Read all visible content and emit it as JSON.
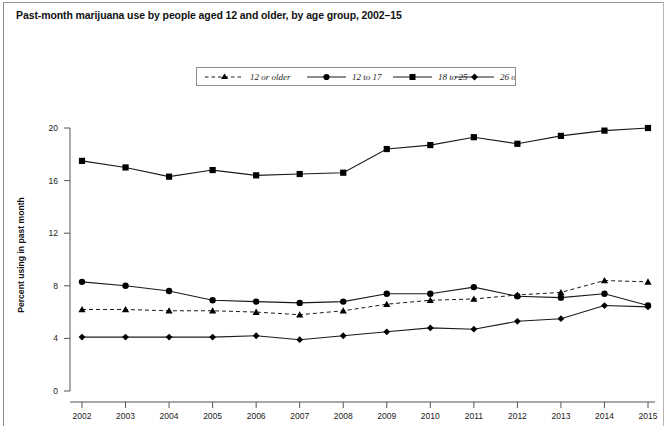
{
  "figure": {
    "title": "Past-month marijuana use by people aged 12 and older, by age group, 2002–15"
  },
  "legend": {
    "position": "top-center",
    "entries": [
      {
        "label": "12 or older",
        "marker": "triangle",
        "line": "dashed"
      },
      {
        "label": "12 to 17",
        "marker": "circle",
        "line": "solid"
      },
      {
        "label": "18 to 25",
        "marker": "square",
        "line": "solid"
      },
      {
        "label": "26 or older",
        "marker": "diamond",
        "line": "solid"
      }
    ]
  },
  "axes": {
    "ylabel": "Percent using in past month",
    "xlabel": "",
    "yticks": [
      "0",
      "4",
      "8",
      "12",
      "16",
      "20"
    ],
    "xticks": [
      "2002",
      "2003",
      "2004",
      "2005",
      "2006",
      "2007",
      "2008",
      "2009",
      "2010",
      "2011",
      "2012",
      "2013",
      "2014",
      "2015"
    ]
  },
  "colors": {
    "line": "#1a1a1a",
    "marker": "#000000",
    "axis": "#555555",
    "background": "#ffffff"
  },
  "chart_data": {
    "type": "line",
    "title": "Past-month marijuana use by people aged 12 and older, by age group, 2002–15",
    "xlabel": "",
    "ylabel": "Percent using in past month",
    "x": [
      2002,
      2003,
      2004,
      2005,
      2006,
      2007,
      2008,
      2009,
      2010,
      2011,
      2012,
      2013,
      2014,
      2015
    ],
    "xlim": [
      2002,
      2015
    ],
    "ylim": [
      0,
      20
    ],
    "yticks": [
      0,
      4,
      8,
      12,
      16,
      20
    ],
    "grid": false,
    "legend_position": "top-center",
    "series": [
      {
        "name": "12 or older",
        "marker": "triangle",
        "line": "dashed",
        "values": [
          6.2,
          6.2,
          6.1,
          6.1,
          6.0,
          5.8,
          6.1,
          6.6,
          6.9,
          7.0,
          7.3,
          7.5,
          8.4,
          8.3
        ]
      },
      {
        "name": "12 to 17",
        "marker": "circle",
        "line": "solid",
        "values": [
          8.3,
          8.0,
          7.6,
          6.9,
          6.8,
          6.7,
          6.8,
          7.4,
          7.4,
          7.9,
          7.2,
          7.1,
          7.4,
          6.5
        ]
      },
      {
        "name": "18 to 25",
        "marker": "square",
        "line": "solid",
        "values": [
          17.5,
          17.0,
          16.3,
          16.8,
          16.4,
          16.5,
          16.6,
          18.4,
          18.7,
          19.3,
          18.8,
          19.4,
          19.8,
          20.0
        ]
      },
      {
        "name": "26 or older",
        "marker": "diamond",
        "line": "solid",
        "values": [
          4.1,
          4.1,
          4.1,
          4.1,
          4.2,
          3.9,
          4.2,
          4.5,
          4.8,
          4.7,
          5.3,
          5.5,
          6.5,
          6.4
        ]
      }
    ]
  }
}
